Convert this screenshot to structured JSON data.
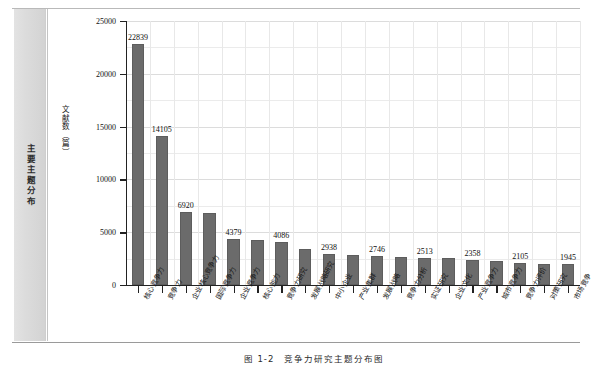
{
  "running_head": {
    "text": "主要主题分布"
  },
  "caption": {
    "number": "图 1-2",
    "title": "竞争力研究主题分布图"
  },
  "chart_data": {
    "type": "bar",
    "title": "",
    "xlabel": "",
    "ylabel": "文献数（篇）",
    "ylim": [
      0,
      25000
    ],
    "ytick_labels": [
      "0",
      "5000",
      "10000",
      "15000",
      "20000",
      "25000"
    ],
    "ytick_values": [
      0,
      5000,
      10000,
      15000,
      20000,
      25000
    ],
    "grid": true,
    "legend": "none",
    "bar_color": "#6b6b6b",
    "categories": [
      "核心竞争力",
      "竞争力",
      "企业核心竞争力",
      "国际竞争力",
      "企业竞争力",
      "核心能力",
      "竞争力研究",
      "发展战略研究",
      "中小企业",
      "产业集群",
      "发展战略",
      "竞争力分析",
      "实证研究",
      "企业文化",
      "产业竞争力",
      "城市竞争力",
      "竞争力评价",
      "对策研究",
      "市场竞争"
    ],
    "values": [
      22839,
      14105,
      6920,
      6850,
      4379,
      4280,
      4086,
      3380,
      2938,
      2800,
      2746,
      2650,
      2513,
      2600,
      2358,
      2240,
      2105,
      1980,
      1945
    ],
    "labeled_values": [
      {
        "index": 0,
        "label": "22839"
      },
      {
        "index": 2,
        "label": "6920"
      },
      {
        "index": 4,
        "label": "4379"
      },
      {
        "index": 6,
        "label": "4086"
      },
      {
        "index": 8,
        "label": "2938"
      },
      {
        "index": 10,
        "label": "2746"
      },
      {
        "index": 12,
        "label": "2513"
      },
      {
        "index": 14,
        "label": "2358"
      },
      {
        "index": 16,
        "label": "2105"
      },
      {
        "index": 18,
        "label": "1945"
      }
    ],
    "secondary_labeled_values": [
      {
        "index": 1,
        "label": "14105"
      }
    ]
  }
}
